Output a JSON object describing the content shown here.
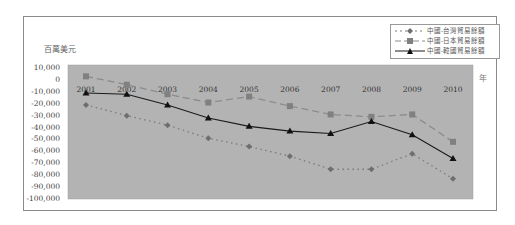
{
  "chart_data": {
    "type": "line",
    "title": "",
    "xlabel": "年",
    "ylabel": "百萬美元",
    "x": [
      "2001",
      "2002",
      "2003",
      "2004",
      "2005",
      "2006",
      "2007",
      "2008",
      "2009",
      "2010"
    ],
    "ylim": [
      -100000,
      10000
    ],
    "yticks": [
      "10,000",
      "0",
      "-10,000",
      "-20,000",
      "-30,000",
      "-40,000",
      "-50,000",
      "-60,000",
      "-70,000",
      "-80,000",
      "-90,000",
      "-100,000"
    ],
    "grid": false,
    "plot_background": "#b3b3b3",
    "legend_position": "top-right",
    "series": [
      {
        "name": "中國-台灣貿易餘額",
        "style": "dotted",
        "marker": "diamond",
        "color": "#7a7a7a",
        "values": [
          -21000,
          -30000,
          -38000,
          -49000,
          -56000,
          -64000,
          -75000,
          -75000,
          -62000,
          -83000
        ]
      },
      {
        "name": "中國-日本貿易餘額",
        "style": "dashed",
        "marker": "square",
        "color": "#8c8c8c",
        "values": [
          3000,
          -4000,
          -12000,
          -19000,
          -14000,
          -22000,
          -29000,
          -31000,
          -29000,
          -52000
        ]
      },
      {
        "name": "中國-韓國貿易餘額",
        "style": "solid",
        "marker": "triangle",
        "color": "#1a1a1a",
        "values": [
          -11000,
          -12000,
          -21000,
          -32000,
          -39000,
          -43000,
          -45000,
          -35000,
          -46000,
          -66000
        ]
      }
    ]
  },
  "labels": {
    "y_unit": "百萬美元",
    "x_unit": "年"
  }
}
